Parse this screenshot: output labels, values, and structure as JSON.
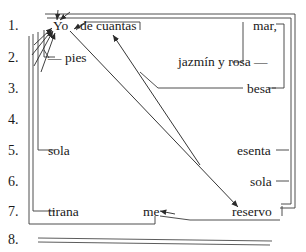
{
  "diagram": {
    "line_numbers": [
      {
        "label": "1.",
        "x": 8,
        "y": 26
      },
      {
        "label": "2.",
        "x": 8,
        "y": 58
      },
      {
        "label": "3.",
        "x": 8,
        "y": 89
      },
      {
        "label": "4.",
        "x": 8,
        "y": 120
      },
      {
        "label": "5.",
        "x": 8,
        "y": 151
      },
      {
        "label": "6.",
        "x": 8,
        "y": 182
      },
      {
        "label": "7.",
        "x": 8,
        "y": 212
      },
      {
        "label": "8.",
        "x": 8,
        "y": 240
      }
    ],
    "left_words": [
      {
        "text": "Yo",
        "x": 53,
        "y": 26
      },
      {
        "text": "de cuantas",
        "x": 80,
        "y": 26
      },
      {
        "text": "— pies",
        "x": 48,
        "y": 58
      },
      {
        "text": "sola",
        "x": 48,
        "y": 151
      },
      {
        "text": "tirana",
        "x": 48,
        "y": 212
      },
      {
        "text": "me",
        "x": 143,
        "y": 212
      }
    ],
    "right_words": [
      {
        "text": "mar,",
        "x": 253,
        "y": 26
      },
      {
        "text": "jazmín y rosa —",
        "x": 178,
        "y": 62
      },
      {
        "text": "besa",
        "x": 247,
        "y": 89
      },
      {
        "text": "esenta",
        "x": 237,
        "y": 151
      },
      {
        "text": "sola",
        "x": 250,
        "y": 182
      },
      {
        "text": "reservo",
        "x": 232,
        "y": 212
      }
    ],
    "colors": {
      "ink": "#1a1a1a",
      "rule": "#333333",
      "background": "#ffffff"
    }
  }
}
